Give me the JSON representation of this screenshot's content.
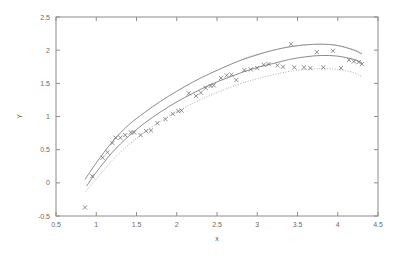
{
  "chart_data": {
    "type": "scatter",
    "title": "",
    "subtitle": "",
    "xlabel": "x",
    "ylabel": "Y",
    "xlim": [
      0.5,
      4.5
    ],
    "ylim": [
      -0.5,
      2.5
    ],
    "xticks": [
      0.5,
      1,
      1.5,
      2,
      2.5,
      3,
      3.5,
      4,
      4.5
    ],
    "xticklabels": [
      "0.5",
      "1",
      "1.5",
      "2",
      "2.5",
      "3",
      "3.5",
      "4",
      "4.5"
    ],
    "yticks": [
      -0.5,
      0,
      0.5,
      1,
      1.5,
      2,
      2.5
    ],
    "yticklabels": [
      "-0.5",
      "0",
      "0.5",
      "1",
      "1.5",
      "2",
      "2.5"
    ],
    "grid": false,
    "legend": "none",
    "marker_symbol": "x",
    "series": [
      {
        "name": "observed data",
        "style": "markers",
        "marker": "x",
        "color": "#6a6a6a",
        "x": [
          0.86,
          0.95,
          1.08,
          1.14,
          1.2,
          1.24,
          1.3,
          1.36,
          1.43,
          1.47,
          1.55,
          1.62,
          1.68,
          1.76,
          1.86,
          1.95,
          2.02,
          2.06,
          2.15,
          2.24,
          2.3,
          2.36,
          2.42,
          2.46,
          2.55,
          2.62,
          2.68,
          2.74,
          2.84,
          2.92,
          3.0,
          3.08,
          3.14,
          3.25,
          3.32,
          3.42,
          3.46,
          3.58,
          3.66,
          3.74,
          3.82,
          3.94,
          4.04,
          4.14,
          4.2,
          4.26,
          4.3
        ],
        "y": [
          -0.37,
          0.1,
          0.38,
          0.46,
          0.6,
          0.68,
          0.68,
          0.72,
          0.76,
          0.76,
          0.72,
          0.78,
          0.79,
          0.9,
          0.96,
          1.04,
          1.08,
          1.09,
          1.35,
          1.31,
          1.36,
          1.43,
          1.46,
          1.47,
          1.58,
          1.62,
          1.63,
          1.55,
          1.7,
          1.71,
          1.73,
          1.78,
          1.79,
          1.77,
          1.75,
          2.09,
          1.74,
          1.74,
          1.73,
          1.97,
          1.74,
          1.99,
          1.73,
          1.85,
          1.83,
          1.82,
          1.79
        ]
      },
      {
        "name": "upper confidence curve",
        "style": "solid-line",
        "color": "#6e6e6e",
        "x": [
          0.86,
          1.0,
          1.2,
          1.4,
          1.6,
          1.8,
          2.0,
          2.2,
          2.4,
          2.6,
          2.8,
          3.0,
          3.2,
          3.4,
          3.6,
          3.8,
          4.0,
          4.2,
          4.3
        ],
        "y": [
          0.05,
          0.3,
          0.62,
          0.87,
          1.06,
          1.23,
          1.38,
          1.52,
          1.64,
          1.75,
          1.85,
          1.93,
          2.0,
          2.05,
          2.08,
          2.09,
          2.07,
          2.0,
          1.94
        ]
      },
      {
        "name": "fitted regression curve",
        "style": "solid-line",
        "color": "#6e6e6e",
        "x": [
          0.88,
          1.0,
          1.2,
          1.4,
          1.6,
          1.8,
          2.0,
          2.2,
          2.4,
          2.6,
          2.8,
          3.0,
          3.2,
          3.4,
          3.6,
          3.8,
          4.0,
          4.2,
          4.3
        ],
        "y": [
          -0.05,
          0.16,
          0.46,
          0.7,
          0.9,
          1.07,
          1.22,
          1.35,
          1.47,
          1.57,
          1.66,
          1.74,
          1.8,
          1.86,
          1.9,
          1.92,
          1.91,
          1.86,
          1.81
        ]
      },
      {
        "name": "lower confidence curve",
        "style": "dotted-line",
        "color": "#9a9a9a",
        "x": [
          0.86,
          1.0,
          1.2,
          1.4,
          1.6,
          1.8,
          2.0,
          2.2,
          2.4,
          2.6,
          2.8,
          3.0,
          3.2,
          3.4,
          3.6,
          3.8,
          4.0,
          4.2,
          4.3
        ],
        "y": [
          -0.14,
          0.06,
          0.34,
          0.57,
          0.76,
          0.93,
          1.07,
          1.2,
          1.31,
          1.41,
          1.5,
          1.57,
          1.63,
          1.68,
          1.71,
          1.72,
          1.71,
          1.66,
          1.6
        ]
      },
      {
        "name": "upper dotted band",
        "style": "dotted-line",
        "color": "#9a9a9a",
        "x": [
          2.8,
          3.0,
          3.2,
          3.4,
          3.6,
          3.8,
          4.0,
          4.2,
          4.3
        ],
        "y": [
          1.86,
          1.94,
          2.0,
          2.05,
          2.08,
          2.09,
          2.07,
          2.01,
          1.96
        ]
      }
    ]
  },
  "axes": {
    "x_title": "x",
    "y_title": "Y"
  }
}
